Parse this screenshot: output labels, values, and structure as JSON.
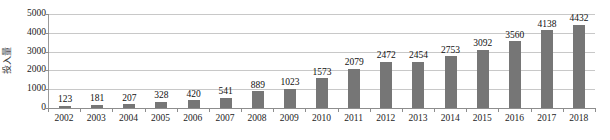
{
  "chart_data": {
    "type": "bar",
    "title": "",
    "xlabel": "",
    "ylabel": "投入量",
    "categories": [
      "2002",
      "2003",
      "2004",
      "2005",
      "2006",
      "2007",
      "2008",
      "2009",
      "2010",
      "2011",
      "2012",
      "2013",
      "2014",
      "2015",
      "2016",
      "2017",
      "2018"
    ],
    "values": [
      123,
      181,
      207,
      328,
      420,
      541,
      889,
      1023,
      1573,
      2079,
      2472,
      2454,
      2753,
      3092,
      3560,
      4138,
      4432
    ],
    "series": [
      {
        "name": "投入量",
        "values": [
          123,
          181,
          207,
          328,
          420,
          541,
          889,
          1023,
          1573,
          2079,
          2472,
          2454,
          2753,
          3092,
          3560,
          4138,
          4432
        ]
      }
    ],
    "ylim": [
      0,
      5000
    ],
    "ytick_values": [
      0,
      1000,
      2000,
      3000,
      4000,
      5000
    ],
    "ytick_labels": [
      "0",
      "1000",
      "2000",
      "3000",
      "4000",
      "5000"
    ],
    "grid": true,
    "grid_axis": "y",
    "legend": false,
    "legend_position": "none",
    "data_labels": true,
    "bar_color": "#767676",
    "gridline_color": "#c8c8c8",
    "axis_color": "#8d8d8d"
  }
}
